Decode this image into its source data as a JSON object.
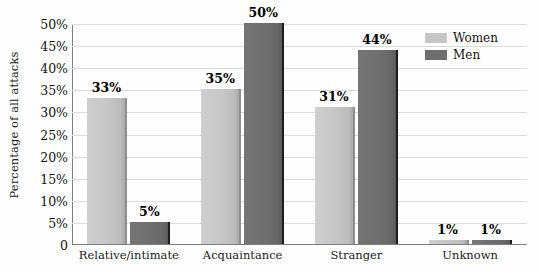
{
  "chart_data": {
    "type": "bar",
    "title": "",
    "xlabel": "",
    "ylabel": "Percentage of all attacks",
    "categories": [
      "Relative/intimate",
      "Acquaintance",
      "Stranger",
      "Unknown"
    ],
    "series": [
      {
        "name": "Women",
        "color": "#c6c6c6",
        "values": [
          33,
          35,
          31,
          1
        ],
        "labels": [
          "33%",
          "35%",
          "31%",
          "1%"
        ]
      },
      {
        "name": "Men",
        "color": "#6e6e6e",
        "values": [
          5,
          50,
          44,
          1
        ],
        "labels": [
          "5%",
          "50%",
          "44%",
          "1%"
        ]
      }
    ],
    "ylim": [
      0,
      50
    ],
    "ytick_values": [
      0,
      5,
      10,
      15,
      20,
      25,
      30,
      35,
      40,
      45,
      50
    ],
    "ytick_labels": [
      "0",
      "5%",
      "10%",
      "15%",
      "20%",
      "25%",
      "30%",
      "35%",
      "40%",
      "45%",
      "50%"
    ],
    "grid": true,
    "legend_position": "top-right",
    "value_labels_shown": true
  },
  "legend": {
    "items": [
      {
        "label": "Women"
      },
      {
        "label": "Men"
      }
    ]
  }
}
